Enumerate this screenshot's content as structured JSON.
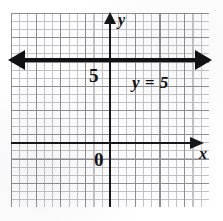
{
  "chart_data": {
    "type": "line",
    "title": "",
    "xlabel": "x",
    "ylabel": "y",
    "xlim": [
      -4,
      4
    ],
    "ylim": [
      -3,
      5
    ],
    "grid": true,
    "legend_position": "none",
    "series": [
      {
        "name": "y = 5",
        "equation": "y = 5",
        "type": "horizontal-line",
        "y_value": 5,
        "extends_infinitely": true,
        "arrow_left": true,
        "arrow_right": true
      }
    ],
    "annotations": [
      {
        "text": "y = 5",
        "kind": "equation-label"
      },
      {
        "text": "5",
        "kind": "y-axis-tick"
      },
      {
        "text": "0",
        "kind": "origin-label"
      }
    ],
    "axis_ticks_labeled": {
      "y": [
        "5"
      ],
      "x": []
    }
  },
  "figure": {
    "axis_y_label": "y",
    "axis_x_label": "x",
    "origin_label": "0",
    "y_tick_label": "5",
    "equation_label": "y = 5",
    "colors": {
      "ink": "#111114",
      "axis": "#17171a",
      "grid_major": "#8d8d93",
      "grid_minor": "#c2c2c6",
      "paper": "#ffffff"
    },
    "icons": {
      "y_axis_arrow": "arrow-up-icon",
      "x_axis_arrow": "arrow-right-icon",
      "line_arrow_left": "arrow-left-icon",
      "line_arrow_right": "arrow-right-icon"
    }
  }
}
